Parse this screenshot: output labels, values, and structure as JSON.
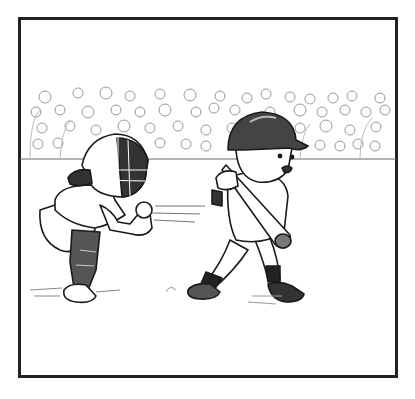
{
  "illustration": {
    "description": "Pencil sketch comic panel of a youth baseball game: a catcher crouching in mask and gear catching a pitch at left, a young batter in a helmet mid-swing follow-through at right, and a crowd of spectators in the stands behind a fence line.",
    "style": "black-and-white pencil sketch",
    "frame": {
      "x": 18,
      "y": 18,
      "width": 380,
      "height": 360,
      "stroke": "#222222"
    },
    "colors": {
      "background": "#ffffff",
      "ink": "#1a1a1a",
      "shade": "#555555",
      "light": "#aaaaaa"
    },
    "elements": [
      "crowd",
      "fence-line",
      "catcher",
      "batter",
      "baseball-bat",
      "ball-dust"
    ]
  }
}
